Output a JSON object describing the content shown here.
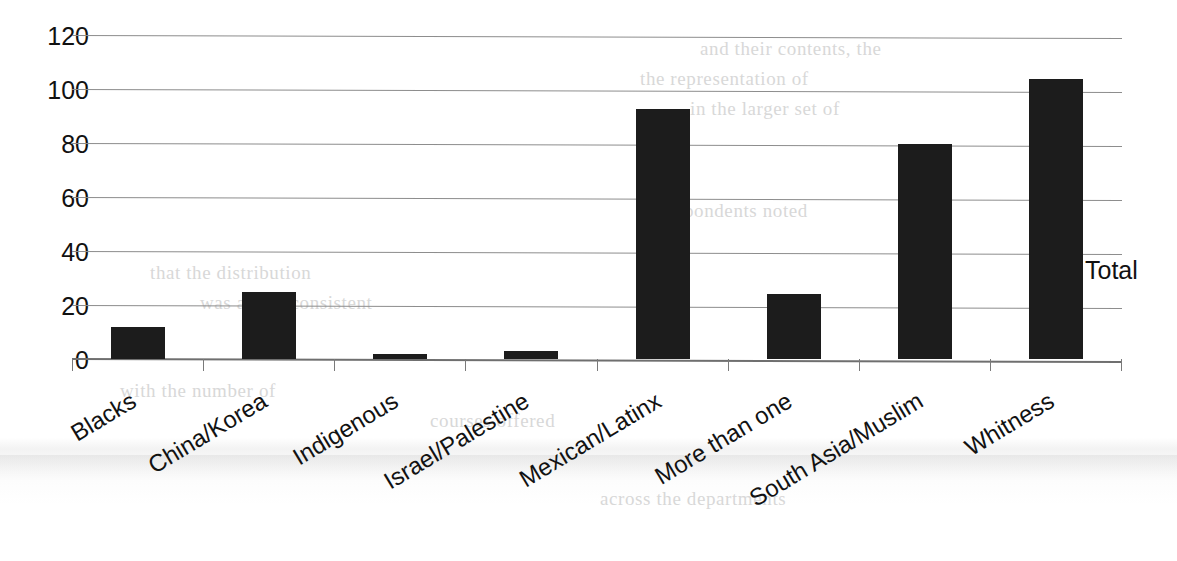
{
  "chart_data": {
    "type": "bar",
    "title": "",
    "subtitle": "",
    "xlabel": "",
    "ylabel": "",
    "categories": [
      "Blacks",
      "China/Korea",
      "Indigenous",
      "Israel/Palestine",
      "Mexican/Latinx",
      "More than one",
      "South Asia/Muslim",
      "Whitness"
    ],
    "values": [
      12,
      25,
      2,
      3,
      93,
      24,
      80,
      104
    ],
    "series": [
      {
        "name": "Total",
        "values": [
          12,
          25,
          2,
          3,
          93,
          24,
          80,
          104
        ]
      }
    ],
    "ylim": [
      0,
      120
    ],
    "ytick_labels": [
      "120",
      "100",
      "80",
      "60",
      "40",
      "20",
      "0"
    ],
    "ytick_values": [
      120,
      100,
      80,
      60,
      40,
      20,
      0
    ],
    "grid": true,
    "legend_position": "right",
    "bar_color": "#1c1c1c",
    "gridline_color": "#8d8d8d",
    "axis_color": "#6f6f6f"
  },
  "legend": {
    "entries": [
      {
        "label": "Total",
        "color": "#1c1c1c",
        "marker": "square"
      }
    ]
  },
  "background": {
    "page_color": "#ffffff",
    "ghost_text": [
      "and their contents, the",
      "the representation of",
      "in the larger set of",
      "respondents noted",
      "that the distribution",
      "was and is consistent",
      "with the number of",
      "courses offered",
      "across the departments"
    ]
  }
}
